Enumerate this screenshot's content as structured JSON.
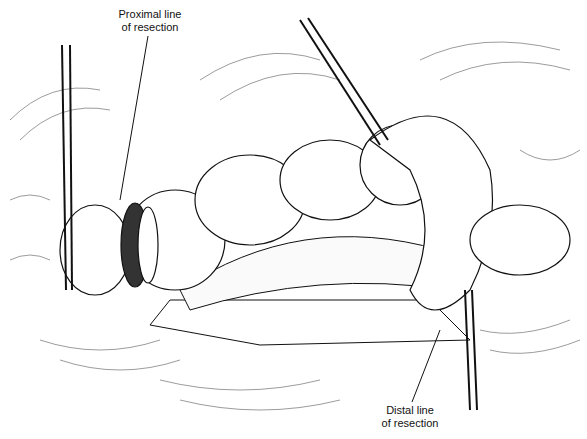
{
  "figure": {
    "labels": {
      "proximal_line1": "Proximal line",
      "proximal_line2": "of resection",
      "distal_line1": "Distal line",
      "distal_line2": "of resection"
    },
    "colors": {
      "background": "#ffffff",
      "ink": "#111111"
    }
  }
}
